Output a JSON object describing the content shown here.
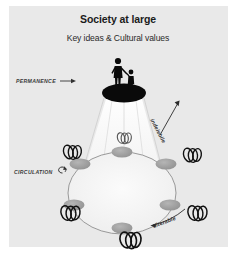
{
  "panel": {
    "background_color": "#e9e9e9",
    "outer_background_color": "#ffffff"
  },
  "header": {
    "title": "Society at large",
    "subtitle": "Key ideas & Cultural values"
  },
  "labels": {
    "permanence": "PERMANENCE",
    "circulation": "CIRCULATION",
    "indelebile": "indelebile",
    "alterable": "alterable"
  },
  "icons": {
    "permanence_arrow": "arrow-right-icon",
    "circulation_arrow": "circular-arrow-icon",
    "indelebile_arrow": "arrow-down-right-icon",
    "alterable_arrow": "arrow-left-icon",
    "figures": "adult-and-child-silhouette-icon",
    "knot": "interlocking-loops-icon"
  },
  "diagram": {
    "type": "conceptual-transmission-diagram",
    "apex": {
      "shape": "ellipse",
      "color": "#0a0a0a",
      "cx": 124,
      "cy": 93,
      "rx": 22,
      "ry": 9.5,
      "label": "society-apex-node"
    },
    "ring": {
      "shape": "ellipse",
      "cx": 122,
      "cy": 193,
      "rx": 54,
      "ry": 41,
      "stroke": "#8e8e8e",
      "fill": "#f3f3f3"
    },
    "node_color": "#9b9b9b",
    "node_count": 6,
    "nodes": [
      {
        "id": "node-top",
        "cx": 122,
        "cy": 152,
        "rx": 10,
        "ry": 5.5
      },
      {
        "id": "node-upper-left",
        "cx": 80,
        "cy": 164,
        "rx": 10,
        "ry": 5.5
      },
      {
        "id": "node-upper-right",
        "cx": 166,
        "cy": 164,
        "rx": 10,
        "ry": 5.5
      },
      {
        "id": "node-lower-left",
        "cx": 74,
        "cy": 205,
        "rx": 10,
        "ry": 5.5
      },
      {
        "id": "node-lower-right",
        "cx": 170,
        "cy": 205,
        "rx": 10,
        "ry": 5.5
      },
      {
        "id": "node-bottom",
        "cx": 122,
        "cy": 228,
        "rx": 10,
        "ry": 5.5
      }
    ],
    "knot_count": 5,
    "knots": [
      {
        "id": "knot-upper-left",
        "cx": 72,
        "cy": 152
      },
      {
        "id": "knot-upper-right",
        "cx": 192,
        "cy": 155
      },
      {
        "id": "knot-lower-left",
        "cx": 70,
        "cy": 213
      },
      {
        "id": "knot-lower-right",
        "cx": 197,
        "cy": 213
      },
      {
        "id": "knot-bottom",
        "cx": 130,
        "cy": 240
      }
    ],
    "cone_stroke": "#b8b8b8",
    "cone_fill": "#f6f6f6"
  }
}
